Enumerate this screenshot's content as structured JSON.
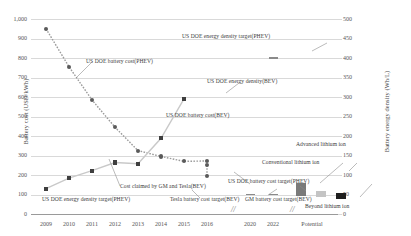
{
  "chart_data": {
    "type": "line",
    "title": "",
    "subtitle": "",
    "xlabel": "",
    "ylabel": "Battery cost (USD/kWh)",
    "ylabel_right": "Battery energy density (Wh/L)",
    "ylim": [
      0,
      1000
    ],
    "ylim_right": [
      0,
      500
    ],
    "grid": true,
    "legend_position": "inline-annotations",
    "categories": [
      "2009",
      "2010",
      "2011",
      "2012",
      "2013",
      "2014",
      "2015",
      "2016",
      "2020",
      "2022",
      "Potential"
    ],
    "yticks": [
      "0",
      "100",
      "200",
      "300",
      "400",
      "500",
      "600",
      "700",
      "800",
      "900",
      "1,000"
    ],
    "yticks_right": [
      "0",
      "50",
      "100",
      "150",
      "200",
      "250",
      "300",
      "350",
      "400",
      "450",
      "500"
    ],
    "axis_breaks": [
      {
        "after": "2016",
        "symbol": "//"
      },
      {
        "after": "2022",
        "symbol": "//"
      }
    ],
    "series": [
      {
        "name": "US DOE battery cost(PHEV)",
        "axis": "left",
        "marker": "circle",
        "color": "#5a5a5a",
        "x": [
          "2009",
          "2010",
          "2011",
          "2012",
          "2013",
          "2014",
          "2015",
          "2016"
        ],
        "values": [
          950,
          755,
          585,
          445,
          325,
          295,
          270,
          272
        ]
      },
      {
        "name": "US DOE energy density(BEV)",
        "axis": "right",
        "marker": "square",
        "color": "#3f3f3f",
        "x": [
          "2009",
          "2010",
          "2011",
          "2012",
          "2013",
          "2014",
          "2015"
        ],
        "values": [
          65,
          92,
          111,
          132,
          129,
          194,
          295
        ]
      },
      {
        "name": "Cost claimed by GM and Tesla(BEV)",
        "axis": "left",
        "marker": "circle",
        "color": "#5a5a5a",
        "x": [
          "2016",
          "2016"
        ],
        "values": [
          250,
          195
        ]
      },
      {
        "name": "US DOE energy density target(PHEV)",
        "axis": "right",
        "marker": "dash",
        "color": "#8a8a8a",
        "x": [
          "2022"
        ],
        "values": [
          400
        ]
      },
      {
        "name": "US DOE battery cost target(PHEV)",
        "axis": "left",
        "marker": "dash",
        "color": "#8a8a8a",
        "x": [
          "2022"
        ],
        "values": [
          100
        ]
      },
      {
        "name": "Tesla battery cost target(BEV)",
        "axis": "left",
        "marker": "dash",
        "color": "#8a8a8a",
        "x": [
          "2020"
        ],
        "values": [
          100
        ]
      },
      {
        "name": "GM battery cost target(BEV)",
        "axis": "left",
        "marker": "dash",
        "color": "#8a8a8a",
        "x": [
          "2022"
        ],
        "values": [
          100
        ]
      }
    ],
    "bars": [
      {
        "name": "Conventional lithium ion",
        "axis": "right",
        "value": 80,
        "color": "#7a7a7a"
      },
      {
        "name": "Advanced lithium ion",
        "axis": "right",
        "value": 60,
        "color": "#c4c4c4"
      },
      {
        "name": "Beyond lithium ion",
        "axis": "right",
        "value": 55,
        "color": "#1e1e1e"
      }
    ],
    "annotations": [
      {
        "id": "a1",
        "text": "US DOE energy density target(PHEV)"
      },
      {
        "id": "a2",
        "text": "US DOE battery cost(PHEV)"
      },
      {
        "id": "a3",
        "text": "US DOE energy density(BEV)"
      },
      {
        "id": "a4",
        "text": "US DOE battery cost(BEV)"
      },
      {
        "id": "a5",
        "text": "Cost claimed by GM and Tesla(BEV)"
      },
      {
        "id": "a6",
        "text": "US DOE energy density target(PHEV)"
      },
      {
        "id": "a7",
        "text": "Tesla battery cost target(BEV)"
      },
      {
        "id": "a8",
        "text": "US DOE battery cost target(PHEV)"
      },
      {
        "id": "a9",
        "text": "GM battery cost target(BEV)"
      },
      {
        "id": "a10",
        "text": "Conventional lithium ion"
      },
      {
        "id": "a11",
        "text": "Advanced lithium ion"
      },
      {
        "id": "a12",
        "text": "Beyond lithium ion"
      }
    ]
  },
  "axes": {
    "left_title": "Battery cost (USD/kWh)",
    "right_title": "Battery energy density (Wh/L)",
    "yticks": [
      "1,000",
      "900",
      "800",
      "700",
      "600",
      "500",
      "400",
      "300",
      "200",
      "100",
      "0"
    ],
    "yticks_right": [
      "500",
      "450",
      "400",
      "350",
      "300",
      "250",
      "200",
      "150",
      "100",
      "50",
      "0"
    ],
    "xticks": [
      "2009",
      "2010",
      "2011",
      "2012",
      "2013",
      "2014",
      "2015",
      "2016",
      "2020",
      "2022",
      "Potential"
    ],
    "break_symbol": "//"
  }
}
